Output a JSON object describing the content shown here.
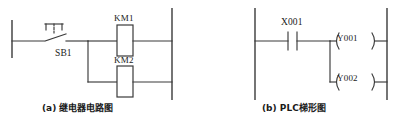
{
  "figure": {
    "title_a": "(a) 继电器电路图",
    "title_b": "(b) PLC梯形图"
  },
  "relay_circuit": {
    "caption": "(a) 继电器电路图",
    "pushbutton": {
      "label": "SB1",
      "icon": "normally-open-pushbutton-icon"
    },
    "coils": [
      {
        "label": "KM1",
        "icon": "relay-coil-icon"
      },
      {
        "label": "KM2",
        "icon": "relay-coil-icon"
      }
    ]
  },
  "plc_ladder": {
    "caption": "(b) PLC梯形图",
    "contact": {
      "label": "X001",
      "icon": "normally-open-contact-icon"
    },
    "outputs": [
      {
        "label": "Y001",
        "icon": "output-coil-icon"
      },
      {
        "label": "Y002",
        "icon": "output-coil-icon"
      }
    ]
  },
  "style": {
    "line_color": "#3a3a3a",
    "text_color": "#1a1a1a",
    "background": "#ffffff"
  }
}
